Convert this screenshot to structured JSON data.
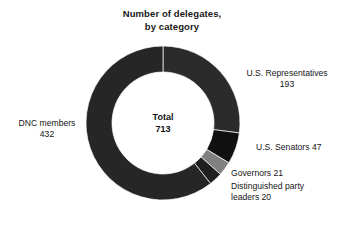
{
  "chart_data": {
    "type": "pie",
    "title": "Number of delegates, by category",
    "title_lines": [
      "Number of delegates,",
      "by category"
    ],
    "xlabel": "",
    "ylabel": "",
    "grid": false,
    "legend_position": "none",
    "donut": true,
    "inner_radius_ratio": 0.66,
    "start_angle_deg": 0,
    "direction": "clockwise",
    "total_label": "Total",
    "total_value": "713",
    "total": 713,
    "categories": [
      "U.S. Representatives",
      "U.S. Senators",
      "Governors",
      "Distinguished party leaders",
      "DNC members"
    ],
    "values": [
      193,
      47,
      21,
      20,
      432
    ],
    "colors": [
      "#2b2b2b",
      "#111111",
      "#808080",
      "#1f1f1f",
      "#262626"
    ],
    "slices": [
      {
        "name": "U.S. Representatives",
        "value": 193,
        "color": "#2b2b2b",
        "label_lines": [
          "U.S. Representatives",
          "193"
        ]
      },
      {
        "name": "U.S. Senators",
        "value": 47,
        "color": "#111111",
        "label_lines": [
          "U.S. Senators 47"
        ]
      },
      {
        "name": "Governors",
        "value": 21,
        "color": "#808080",
        "label_lines": [
          "Governors 21"
        ]
      },
      {
        "name": "Distinguished party leaders",
        "value": 20,
        "color": "#1f1f1f",
        "label_lines": [
          "Distinguished party",
          "leaders 20"
        ]
      },
      {
        "name": "DNC members",
        "value": 432,
        "color": "#262626",
        "label_lines": [
          "DNC members",
          "432"
        ]
      }
    ]
  },
  "callouts": {
    "dnc": {
      "line1": "DNC members",
      "line2": "432"
    },
    "representatives": {
      "line1": "U.S. Representatives",
      "line2": "193"
    },
    "senators": {
      "line1": "U.S. Senators 47"
    },
    "governors": {
      "line1": "Governors 21"
    },
    "leaders": {
      "line1": "Distinguished party",
      "line2": "leaders 20"
    }
  },
  "center": {
    "label": "Total",
    "value": "713"
  },
  "colors": {
    "background": "#ffffff",
    "text": "#151515",
    "title": "#1a1a1a",
    "segment_dark": "#2b2b2b",
    "segment_darkest": "#111111",
    "segment_gray": "#808080"
  }
}
